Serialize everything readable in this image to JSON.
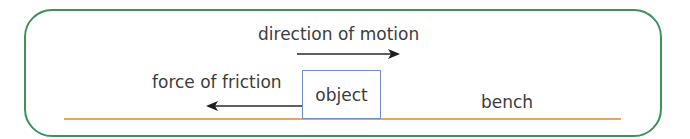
{
  "diagram": {
    "labels": {
      "motion": "direction of motion",
      "friction": "force of friction",
      "object": "object",
      "bench": "bench"
    },
    "colors": {
      "frame": "#3e9159",
      "bench": "#f0a15a",
      "object_border": "#6e8fc9",
      "arrow": "#2a2a2a"
    }
  }
}
